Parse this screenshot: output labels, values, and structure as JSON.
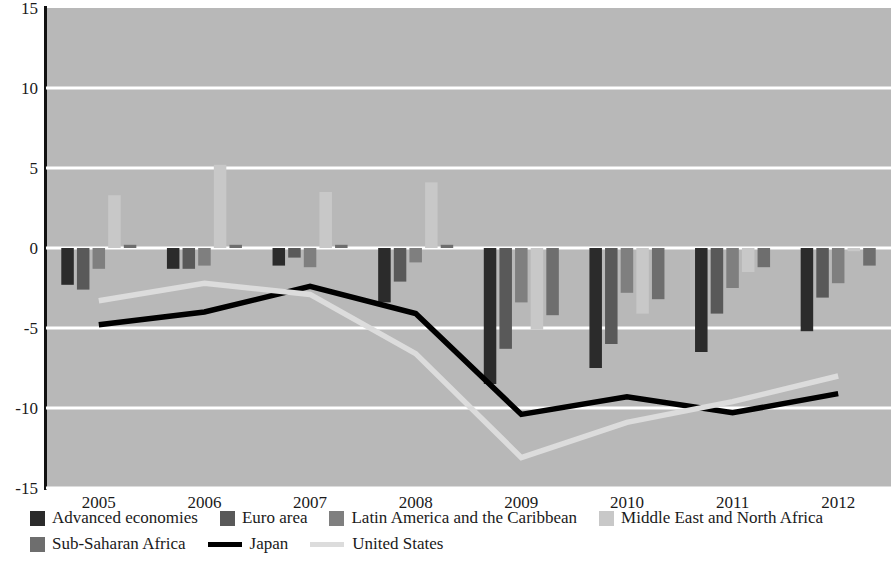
{
  "chart_data": {
    "type": "bar",
    "title": "",
    "subtitle": "",
    "xlabel": "",
    "ylabel": "",
    "categories": [
      "2005",
      "2006",
      "2007",
      "2008",
      "2009",
      "2010",
      "2011",
      "2012"
    ],
    "ylim": [
      -15,
      15
    ],
    "yticks": [
      15,
      10,
      5,
      0,
      -5,
      -10,
      -15
    ],
    "ytick_labels": [
      "15",
      "10",
      "5",
      "0",
      "-5",
      "-10",
      "-15"
    ],
    "grid": true,
    "legend_position": "bottom",
    "series": [
      {
        "name": "Advanced economies",
        "type": "bar",
        "color": "#2b2b2b",
        "values": [
          -2.3,
          -1.3,
          -1.1,
          -3.4,
          -8.5,
          -7.5,
          -6.5,
          -5.2
        ]
      },
      {
        "name": "Euro area",
        "type": "bar",
        "color": "#595959",
        "values": [
          -2.6,
          -1.3,
          -0.6,
          -2.1,
          -6.3,
          -6.0,
          -4.1,
          -3.1
        ]
      },
      {
        "name": "Latin America and the Caribbean",
        "type": "bar",
        "color": "#7f7f7f",
        "values": [
          -1.3,
          -1.1,
          -1.2,
          -0.9,
          -3.4,
          -2.8,
          -2.5,
          -2.2
        ]
      },
      {
        "name": "Middle East and North Africa",
        "type": "bar",
        "color": "#c8c8c8",
        "values": [
          3.3,
          5.2,
          3.5,
          4.1,
          -5.1,
          -4.1,
          -1.5,
          -0.2
        ]
      },
      {
        "name": "Sub-Saharan Africa",
        "type": "bar",
        "color": "#6e6e6e",
        "values": [
          0.2,
          0.2,
          0.2,
          0.2,
          -4.2,
          -3.2,
          -1.2,
          -1.1
        ]
      },
      {
        "name": "Japan",
        "type": "line",
        "color": "#000000",
        "values": [
          -4.8,
          -4.0,
          -2.4,
          -4.1,
          -10.4,
          -9.3,
          -10.3,
          -9.1
        ]
      },
      {
        "name": "United States",
        "type": "line",
        "color": "#dcdcdc",
        "values": [
          -3.3,
          -2.2,
          -2.9,
          -6.6,
          -13.1,
          -10.9,
          -9.6,
          -8.0
        ]
      }
    ]
  },
  "legend": {
    "row1": [
      {
        "label": "Advanced economies",
        "color": "#2b2b2b",
        "kind": "swatch"
      },
      {
        "label": "Euro area",
        "color": "#595959",
        "kind": "swatch"
      },
      {
        "label": "Latin America and the Caribbean",
        "color": "#7f7f7f",
        "kind": "swatch"
      },
      {
        "label": "Middle East and North Africa",
        "color": "#c8c8c8",
        "kind": "swatch"
      }
    ],
    "row2": [
      {
        "label": "Sub-Saharan Africa",
        "color": "#6e6e6e",
        "kind": "swatch"
      },
      {
        "label": "Japan",
        "color": "#000000",
        "kind": "line"
      },
      {
        "label": "United States",
        "color": "#dcdcdc",
        "kind": "line"
      }
    ]
  }
}
